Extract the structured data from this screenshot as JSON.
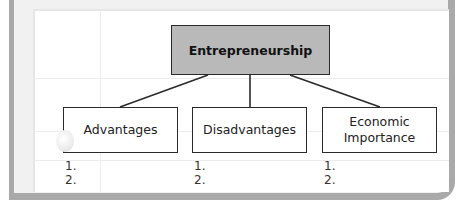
{
  "diagram": {
    "root": {
      "label": "Entrepreneurship",
      "fill": "#b9b9b9"
    },
    "children": [
      {
        "label_line1": "Advantages",
        "label_line2": "",
        "list": [
          "1.",
          "2."
        ]
      },
      {
        "label_line1": "Disadvantages",
        "label_line2": "",
        "list": [
          "1.",
          "2."
        ]
      },
      {
        "label_line1": "Economic",
        "label_line2": "Importance",
        "list": [
          "1.",
          "2."
        ]
      }
    ]
  },
  "colors": {
    "frame": "#a9a9a9",
    "paper": "#ffffff",
    "box_border": "#2a2a2a"
  }
}
